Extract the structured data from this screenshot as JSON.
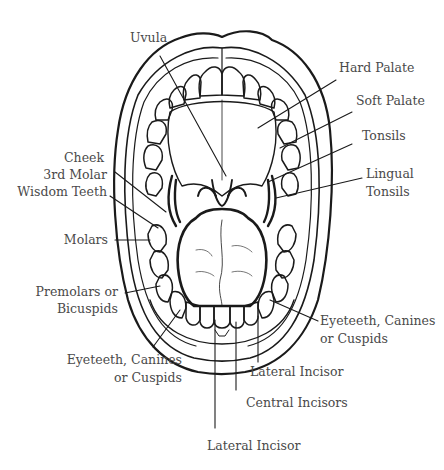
{
  "diagram": {
    "line_color": "#1a1a1a",
    "label_color": "#4a4a4a",
    "labels": {
      "uvula": "Uvula",
      "hard_palate": "Hard Palate",
      "soft_palate": "Soft Palate",
      "tonsils": "Tonsils",
      "lingual_tonsils_1": "Lingual",
      "lingual_tonsils_2": "Tonsils",
      "cheek": "Cheek",
      "third_molar_1": "3rd Molar",
      "third_molar_2": "Wisdom Teeth",
      "molars": "Molars",
      "premolars_1": "Premolars or",
      "premolars_2": "Bicuspids",
      "eyeteeth_left_1": "Eyeteeth, Canines",
      "eyeteeth_left_2": "or Cuspids",
      "eyeteeth_right_1": "Eyeteeth, Canines",
      "eyeteeth_right_2": "or Cuspids",
      "lateral_incisor_right": "Lateral Incisor",
      "central_incisors": "Central Incisors",
      "lateral_incisor_bottom": "Lateral Incisor"
    }
  }
}
